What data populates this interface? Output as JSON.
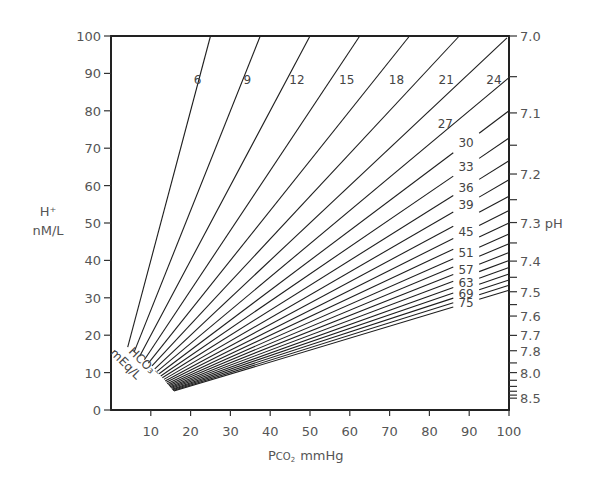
{
  "chart_data": {
    "type": "line",
    "title": "",
    "xlabel": "PCO2 mmHg",
    "xlabel_main": "P",
    "xlabel_sub": "CO",
    "xlabel_sub2": "2",
    "xlabel_unit": "mmHg",
    "ylabel_line1": "H⁺",
    "ylabel_line2": "nM/L",
    "ylabel": "H+ nM/L",
    "y2label": "pH",
    "series_label_line1": "HCO₃⁻",
    "series_label_line2": "mEq/L",
    "xlim": [
      0,
      100
    ],
    "ylim": [
      0,
      100
    ],
    "x_ticks": [
      10,
      20,
      30,
      40,
      50,
      60,
      70,
      80,
      90,
      100
    ],
    "y_ticks": [
      0,
      10,
      20,
      30,
      40,
      50,
      60,
      70,
      80,
      90,
      100
    ],
    "ph_ticks": [
      {
        "ph": "7.0",
        "labeled": true
      },
      {
        "ph": "7.05",
        "labeled": false
      },
      {
        "ph": "7.1",
        "labeled": true
      },
      {
        "ph": "7.15",
        "labeled": false
      },
      {
        "ph": "7.2",
        "labeled": true
      },
      {
        "ph": "7.25",
        "labeled": false
      },
      {
        "ph": "7.3",
        "labeled": true,
        "suffix": " pH"
      },
      {
        "ph": "7.35",
        "labeled": false
      },
      {
        "ph": "7.4",
        "labeled": true
      },
      {
        "ph": "7.45",
        "labeled": false
      },
      {
        "ph": "7.5",
        "labeled": true
      },
      {
        "ph": "7.55",
        "labeled": false
      },
      {
        "ph": "7.6",
        "labeled": true
      },
      {
        "ph": "7.7",
        "labeled": true
      },
      {
        "ph": "7.8",
        "labeled": true
      },
      {
        "ph": "7.9",
        "labeled": false
      },
      {
        "ph": "8.0",
        "labeled": true
      },
      {
        "ph": "8.1",
        "labeled": false
      },
      {
        "ph": "8.2",
        "labeled": false
      },
      {
        "ph": "8.3",
        "labeled": false
      },
      {
        "ph": "8.4",
        "labeled": false
      },
      {
        "ph": "8.5",
        "labeled": true
      }
    ],
    "relation": "H+ = 24 * PCO2 / HCO3",
    "grid": false,
    "series": [
      {
        "name": "6",
        "hco3": 6,
        "x_start": 4.2,
        "labeled": true,
        "label_pos": "top"
      },
      {
        "name": "9",
        "hco3": 9,
        "x_start": 5.8,
        "labeled": true,
        "label_pos": "top"
      },
      {
        "name": "12",
        "hco3": 12,
        "x_start": 7.2,
        "labeled": true,
        "label_pos": "top"
      },
      {
        "name": "15",
        "hco3": 15,
        "x_start": 8.4,
        "labeled": true,
        "label_pos": "top"
      },
      {
        "name": "18",
        "hco3": 18,
        "x_start": 9.4,
        "labeled": true,
        "label_pos": "top"
      },
      {
        "name": "21",
        "hco3": 21,
        "x_start": 10.3,
        "labeled": true,
        "label_pos": "top"
      },
      {
        "name": "24",
        "hco3": 24,
        "x_start": 11.0,
        "labeled": true,
        "label_pos": "top"
      },
      {
        "name": "27",
        "hco3": 27,
        "x_start": 11.6,
        "labeled": true,
        "label_pos": "right"
      },
      {
        "name": "30",
        "hco3": 30,
        "x_start": 12.1,
        "labeled": true,
        "label_pos": "right"
      },
      {
        "name": "33",
        "hco3": 33,
        "x_start": 12.5,
        "labeled": true,
        "label_pos": "right"
      },
      {
        "name": "36",
        "hco3": 36,
        "x_start": 12.9,
        "labeled": true,
        "label_pos": "right"
      },
      {
        "name": "39",
        "hco3": 39,
        "x_start": 13.3,
        "labeled": true,
        "label_pos": "right"
      },
      {
        "name": "42",
        "hco3": 42,
        "x_start": 13.6,
        "labeled": false,
        "label_pos": "right"
      },
      {
        "name": "45",
        "hco3": 45,
        "x_start": 13.9,
        "labeled": true,
        "label_pos": "right"
      },
      {
        "name": "48",
        "hco3": 48,
        "x_start": 14.1,
        "labeled": false,
        "label_pos": "right"
      },
      {
        "name": "51",
        "hco3": 51,
        "x_start": 14.4,
        "labeled": true,
        "label_pos": "right"
      },
      {
        "name": "54",
        "hco3": 54,
        "x_start": 14.6,
        "labeled": false,
        "label_pos": "right"
      },
      {
        "name": "57",
        "hco3": 57,
        "x_start": 14.8,
        "labeled": true,
        "label_pos": "right"
      },
      {
        "name": "60",
        "hco3": 60,
        "x_start": 15.0,
        "labeled": false,
        "label_pos": "right"
      },
      {
        "name": "63",
        "hco3": 63,
        "x_start": 15.2,
        "labeled": true,
        "label_pos": "right"
      },
      {
        "name": "66",
        "hco3": 66,
        "x_start": 15.3,
        "labeled": false,
        "label_pos": "right"
      },
      {
        "name": "69",
        "hco3": 69,
        "x_start": 15.5,
        "labeled": true,
        "label_pos": "right"
      },
      {
        "name": "72",
        "hco3": 72,
        "x_start": 15.6,
        "labeled": false,
        "label_pos": "right"
      },
      {
        "name": "75",
        "hco3": 75,
        "x_start": 15.8,
        "labeled": true,
        "label_pos": "right"
      }
    ]
  }
}
